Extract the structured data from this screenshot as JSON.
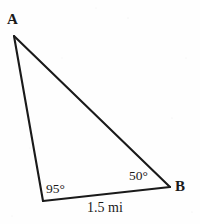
{
  "figure": {
    "type": "triangle-diagram",
    "background_color": "#fefefe",
    "stroke_color": "#1a1a1a",
    "text_color": "#1a1a1a",
    "width": 200,
    "height": 224,
    "vertices": [
      {
        "name": "A",
        "label": "A",
        "x": 14,
        "y": 36,
        "labeled": true
      },
      {
        "name": "B",
        "label": "B",
        "x": 170,
        "y": 187,
        "labeled": true
      },
      {
        "name": "C",
        "label": "",
        "x": 43,
        "y": 201,
        "labeled": false
      }
    ],
    "edges": [
      {
        "name": "edge-a-c",
        "from": "A",
        "to": "C"
      },
      {
        "name": "edge-a-b",
        "from": "A",
        "to": "B"
      },
      {
        "name": "edge-c-b",
        "from": "C",
        "to": "B"
      }
    ],
    "angles": {
      "at_c": "95°",
      "at_b": "50°"
    },
    "sides": {
      "cb_length": "1.5 mi"
    }
  }
}
